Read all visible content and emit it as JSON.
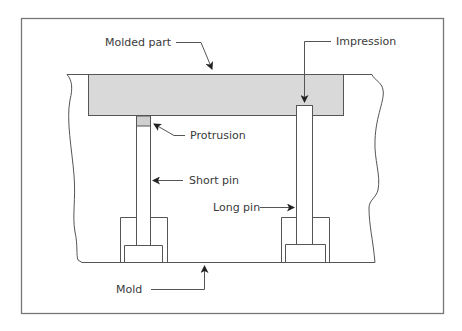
{
  "diagram": {
    "colors": {
      "part_fill": "#d9d9d9",
      "line": "#555555",
      "frame": "#777777",
      "text": "#3a3a3a"
    },
    "labels": {
      "molded_part": "Molded part",
      "impression": "Impression",
      "protrusion": "Protrusion",
      "short_pin": "Short pin",
      "long_pin": "Long pin",
      "mold": "Mold"
    }
  }
}
